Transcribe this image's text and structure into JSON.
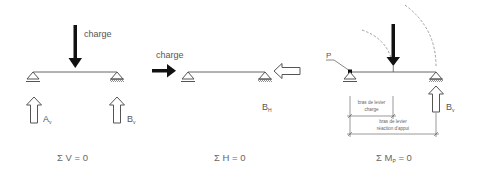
{
  "panels": [
    {
      "id": "vertical-equilibrium",
      "load_label": "charge",
      "reaction_left": {
        "main": "A",
        "sub": "v"
      },
      "reaction_right": {
        "main": "B",
        "sub": "v"
      },
      "equation": {
        "prefix": "Σ V = 0"
      }
    },
    {
      "id": "horizontal-equilibrium",
      "load_label": "charge",
      "reaction_right": {
        "main": "B",
        "sub": "H"
      },
      "equation": {
        "prefix": "Σ H = 0"
      }
    },
    {
      "id": "moment-equilibrium",
      "point_label": "P",
      "reaction_right": {
        "main": "B",
        "sub": "v"
      },
      "dimension_load": {
        "line1": "bras de levier",
        "line2": "charge"
      },
      "dimension_reaction": {
        "line1": "bras de levier",
        "line2": "réaction d'appui"
      },
      "equation": {
        "prefix": "Σ M",
        "sub": "P",
        "suffix": " = 0"
      }
    }
  ],
  "colors": {
    "line": "#555555",
    "load_arrow": "#111111",
    "dashed": "#888888",
    "text": "#555555"
  }
}
